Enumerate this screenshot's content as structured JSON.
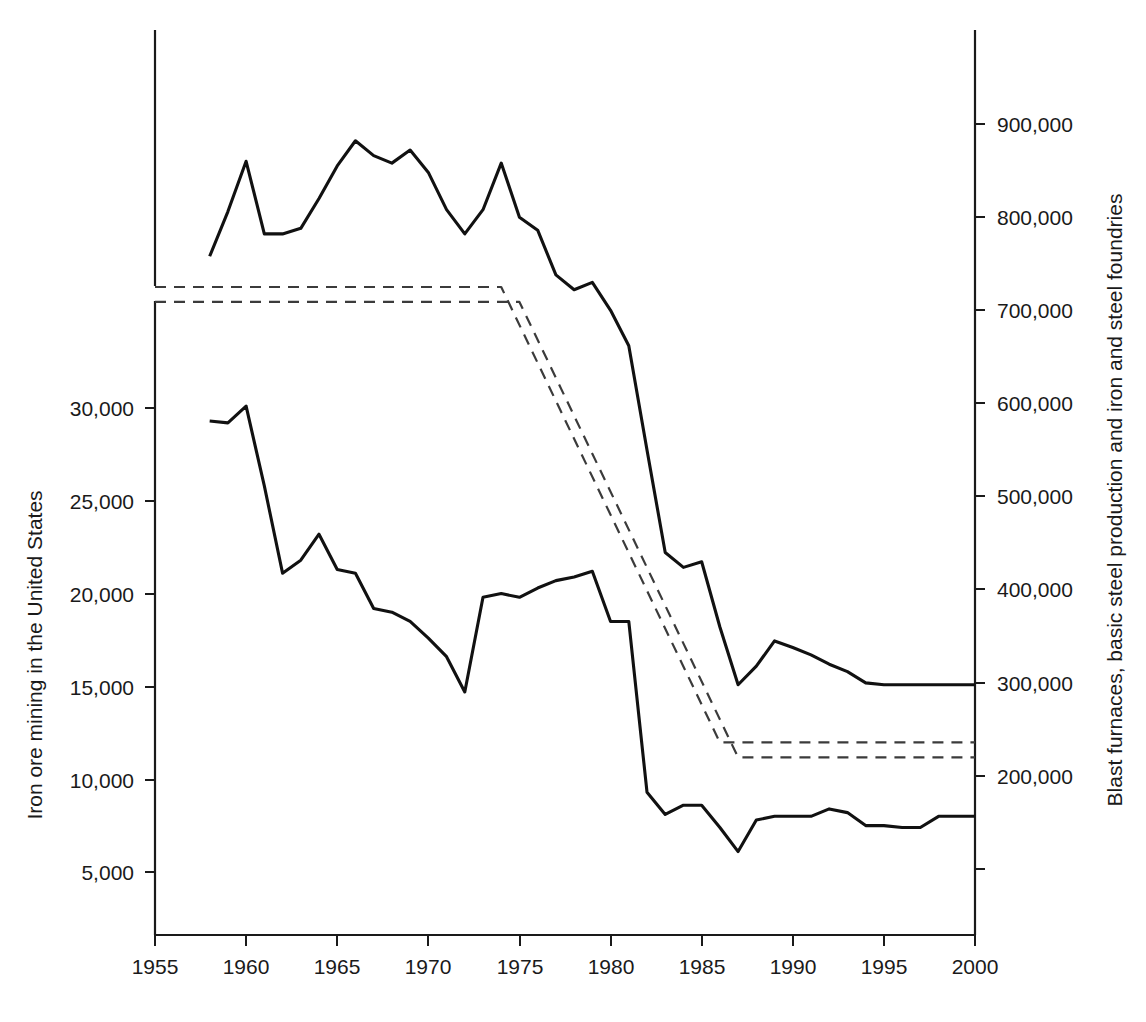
{
  "chart_data": {
    "type": "line",
    "title": "",
    "subtitle": "",
    "xlabel": "",
    "ylabel": "Iron ore mining in the United States",
    "ylabel_right": "Blast furnaces, basic steel production and iron and steel foundries",
    "grid": false,
    "legend": "none",
    "x_axis": {
      "label": "",
      "ticks": [
        1955,
        1960,
        1965,
        1970,
        1975,
        1980,
        1985,
        1990,
        1995,
        2000
      ],
      "tick_labels": [
        "1955",
        "1960",
        "1965",
        "1970",
        "1975",
        "1980",
        "1985",
        "1990",
        "1995",
        "2000"
      ],
      "xlim": [
        1955,
        2000
      ]
    },
    "y_axis_left": {
      "label": "Iron ore mining in the United States",
      "ticks": [
        5000,
        10000,
        15000,
        20000,
        25000,
        30000
      ],
      "tick_labels": [
        "5,000",
        "10,000",
        "15,000",
        "20,000",
        "25,000",
        "30,000"
      ],
      "ylim": [
        0,
        32500
      ],
      "axis_break": true
    },
    "y_axis_right": {
      "label": "Blast furnaces, basic steel production and iron and steel foundries",
      "ticks": [
        100000,
        200000,
        300000,
        400000,
        500000,
        600000,
        700000,
        800000,
        900000
      ],
      "tick_labels": [
        "",
        "200,000",
        "300,000",
        "400,000",
        "500,000",
        "600,000",
        "700,000",
        "800,000",
        "900,000"
      ],
      "ylim": [
        0,
        1000000
      ]
    },
    "series": [
      {
        "name": "Blast furnaces, basic steel production and iron and steel foundries",
        "axis": "right",
        "style": "solid",
        "x": [
          1958,
          1959,
          1960,
          1961,
          1962,
          1963,
          1964,
          1965,
          1966,
          1967,
          1968,
          1969,
          1970,
          1971,
          1972,
          1973,
          1974,
          1975,
          1976,
          1977,
          1978,
          1979,
          1980,
          1981,
          1982,
          1983,
          1984,
          1985,
          1986,
          1987,
          1988,
          1989,
          1990,
          1991,
          1992,
          1993,
          1994,
          1995,
          1996,
          1997,
          1998,
          1999,
          2000
        ],
        "y": [
          758000,
          806000,
          860000,
          782000,
          782000,
          788000,
          820000,
          855000,
          882000,
          866000,
          858000,
          872000,
          848000,
          808000,
          782000,
          808000,
          858000,
          800000,
          786000,
          738000,
          722000,
          730000,
          700000,
          662000,
          550000,
          440000,
          424000,
          430000,
          360000,
          298000,
          318000,
          345000,
          338000,
          330000,
          320000,
          312000,
          300000,
          298000,
          298000,
          298000,
          298000,
          298000,
          298000
        ]
      },
      {
        "name": "Iron ore mining in the United States",
        "axis": "left",
        "style": "solid",
        "x": [
          1958,
          1959,
          1960,
          1961,
          1962,
          1963,
          1964,
          1965,
          1966,
          1967,
          1968,
          1969,
          1970,
          1971,
          1972,
          1973,
          1974,
          1975,
          1976,
          1977,
          1978,
          1979,
          1980,
          1981,
          1982,
          1983,
          1984,
          1985,
          1986,
          1987,
          1988,
          1989,
          1990,
          1991,
          1992,
          1993,
          1994,
          1995,
          1996,
          1997,
          1998,
          1999,
          2000
        ],
        "y": [
          29300,
          29200,
          30100,
          25800,
          21100,
          21800,
          23200,
          21300,
          21100,
          19200,
          19000,
          18500,
          17600,
          16600,
          14700,
          19800,
          20000,
          19800,
          20300,
          20700,
          20900,
          21200,
          18500,
          18500,
          9300,
          8100,
          8600,
          8600,
          7400,
          6100,
          7800,
          8000,
          8000,
          8000,
          8400,
          8200,
          7500,
          7500,
          7400,
          7400,
          8000,
          8000,
          8000
        ]
      },
      {
        "name": "Upper dashed reference band",
        "axis": "right",
        "style": "dashed",
        "x": [
          1955,
          1974,
          1986,
          2000
        ],
        "y": [
          725000,
          725000,
          236000,
          236000
        ]
      },
      {
        "name": "Lower dashed reference band",
        "axis": "right",
        "style": "dashed",
        "x": [
          1955,
          1975,
          1987,
          2000
        ],
        "y": [
          709000,
          709000,
          220000,
          220000
        ]
      }
    ]
  },
  "axis_titles": {
    "left": "Iron ore mining in the United States",
    "right": "Blast furnaces, basic steel production and iron and steel foundries"
  },
  "x_tick_labels": [
    "1955",
    "1960",
    "1965",
    "1970",
    "1975",
    "1980",
    "1985",
    "1990",
    "1995",
    "2000"
  ],
  "left_tick_labels": [
    "30,000",
    "25,000",
    "20,000",
    "15,000",
    "10,000",
    "5,000"
  ],
  "right_tick_labels": [
    "900,000",
    "800,000",
    "700,000",
    "600,000",
    "500,000",
    "400,000",
    "300,000",
    "200,000"
  ],
  "colors": {
    "line": "#111111",
    "dashed_line": "#3b3b3b",
    "axis": "#1a1a1a",
    "text": "#1a1a1a",
    "background": "#ffffff"
  }
}
